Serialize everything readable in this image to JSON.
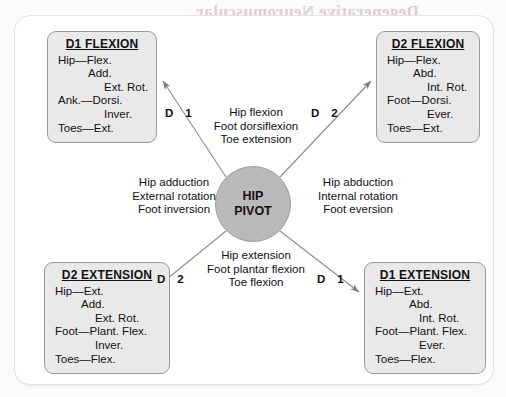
{
  "diagram": {
    "hub": {
      "line1": "HIP",
      "line2": "PIVOT"
    },
    "boxes": {
      "d1_flexion": {
        "title": "D1 FLEXION",
        "lines": [
          "Hip—Flex.",
          "Add.",
          "Ext. Rot.",
          "Ank.—Dorsi.",
          "Inver.",
          "Toes—Ext."
        ]
      },
      "d2_flexion": {
        "title": "D2 FLEXION",
        "lines": [
          "Hip—Flex.",
          "Abd.",
          "Int. Rot.",
          "Foot—Dorsi.",
          "Ever.",
          "Toes—Ext."
        ]
      },
      "d2_extension": {
        "title": "D2 EXTENSION",
        "lines": [
          "Hip—Ext.",
          "Add.",
          "Ext. Rot.",
          "Foot—Plant. Flex.",
          "Inver.",
          "Toes—Flex."
        ]
      },
      "d1_extension": {
        "title": "D1 EXTENSION",
        "lines": [
          "Hip—Ext.",
          "Abd.",
          "Int. Rot.",
          "Foot—Plant. Flex.",
          "Ever.",
          "Toes—Flex."
        ]
      }
    },
    "motion_labels": {
      "top": [
        "Hip flexion",
        "Foot dorsiflexion",
        "Toe extension"
      ],
      "bottom": [
        "Hip extension",
        "Foot plantar flexion",
        "Toe flexion"
      ],
      "left": [
        "Hip adduction",
        "External rotation",
        "Foot inversion"
      ],
      "right": [
        "Hip abduction",
        "Internal rotation",
        "Foot eversion"
      ]
    },
    "diagonal_labels": {
      "top_left": {
        "letter": "D",
        "number": "1"
      },
      "top_right": {
        "letter": "D",
        "number": "2"
      },
      "bottom_left": {
        "letter": "D",
        "number": "2"
      },
      "bottom_right": {
        "letter": "D",
        "number": "1"
      }
    },
    "bleed_through": {
      "line1": "Degenerative Neuromuscular",
      "line2": "Disorders",
      "line3": "reinnervation of muscle fibers",
      "line4": "progressive weakness over time",
      "line5": "adapted from standard rehabilitation texts"
    },
    "colors": {
      "box_fill": "#e9e9e9",
      "box_border": "#9a9a9a",
      "hub_fill": "#b9b9b9",
      "hub_border": "#9c9c9c",
      "line": "#8d8d8d",
      "text": "#111111",
      "page_background": "#fbfbfb",
      "card_background": "#ffffff"
    }
  }
}
